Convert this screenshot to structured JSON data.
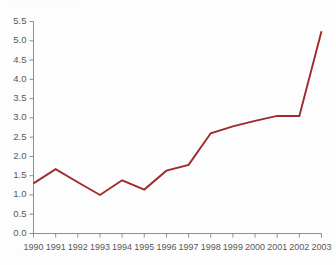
{
  "chart_data": {
    "type": "line",
    "title": "",
    "subtitle": "",
    "xlabel": "",
    "ylabel": "",
    "x": [
      1990,
      1991,
      1992,
      1993,
      1994,
      1995,
      1996,
      1997,
      1998,
      1999,
      2000,
      2001,
      2002,
      2003
    ],
    "categories": [
      "1990",
      "1991",
      "1992",
      "1993",
      "1994",
      "1995",
      "1996",
      "1997",
      "1998",
      "1999",
      "2000",
      "2001",
      "2002",
      "2003"
    ],
    "values": [
      1.3,
      1.67,
      1.33,
      1.0,
      1.38,
      1.14,
      1.63,
      1.78,
      2.6,
      2.78,
      2.92,
      3.05,
      3.05,
      5.25
    ],
    "series": [
      {
        "name": "series-1",
        "color": "#9e2b2b",
        "values": [
          1.3,
          1.67,
          1.33,
          1.0,
          1.38,
          1.14,
          1.63,
          1.78,
          2.6,
          2.78,
          2.92,
          3.05,
          3.05,
          5.25
        ]
      }
    ],
    "ylim": [
      0.0,
      5.5
    ],
    "xlim": [
      1990,
      2003
    ],
    "ytick_labels": [
      "0.0",
      "0.5",
      "1.0",
      "1.5",
      "2.0",
      "2.5",
      "3.0",
      "3.5",
      "4.0",
      "4.5",
      "5.0",
      "5.5"
    ],
    "ytick_values": [
      0.0,
      0.5,
      1.0,
      1.5,
      2.0,
      2.5,
      3.0,
      3.5,
      4.0,
      4.5,
      5.0,
      5.5
    ],
    "xtick_labels": [
      "1990",
      "1991",
      "1992",
      "1993",
      "1994",
      "1995",
      "1996",
      "1997",
      "1998",
      "1999",
      "2000",
      "2001",
      "2002",
      "2003"
    ],
    "grid": false,
    "legend": false,
    "legend_position": "none",
    "annotations": []
  },
  "colors": {
    "line": "#9e2b2b",
    "axis": "#8e8e90",
    "tick_text": "#58585a",
    "background": "#fdfdfd"
  },
  "title_remnant": "· · ·  · ·· ·   ·· ··"
}
